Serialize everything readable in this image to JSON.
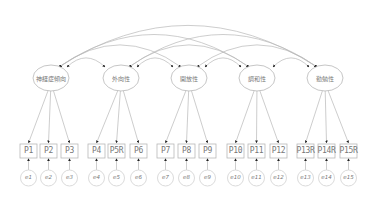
{
  "diagram": {
    "type": "sem-path-diagram",
    "title": "",
    "colors": {
      "line": "#b8b8b8",
      "arrowhead": "#222222",
      "text": "#777777",
      "background": "#ffffff"
    },
    "latent_factors": [
      {
        "id": "F1",
        "label": "神経症傾向",
        "cx": 51,
        "cy": 78
      },
      {
        "id": "F2",
        "label": "外向性",
        "cx": 121,
        "cy": 78
      },
      {
        "id": "F3",
        "label": "開放性",
        "cx": 189,
        "cy": 78
      },
      {
        "id": "F4",
        "label": "調和性",
        "cx": 257,
        "cy": 78
      },
      {
        "id": "F5",
        "label": "勤勉性",
        "cx": 325,
        "cy": 78
      }
    ],
    "observed": [
      {
        "label": "P1",
        "x": 20,
        "factor": "F1",
        "error": "e1"
      },
      {
        "label": "P2",
        "x": 40,
        "factor": "F1",
        "error": "e2"
      },
      {
        "label": "P3",
        "x": 61,
        "factor": "F1",
        "error": "e3"
      },
      {
        "label": "P4",
        "x": 88,
        "factor": "F2",
        "error": "e4"
      },
      {
        "label": "P5R",
        "x": 108,
        "factor": "F2",
        "error": "e5"
      },
      {
        "label": "P6",
        "x": 130,
        "factor": "F2",
        "error": "e6"
      },
      {
        "label": "P7",
        "x": 157,
        "factor": "F3",
        "error": "e7"
      },
      {
        "label": "P8",
        "x": 178,
        "factor": "F3",
        "error": "e8"
      },
      {
        "label": "P9",
        "x": 199,
        "factor": "F3",
        "error": "e9"
      },
      {
        "label": "P10",
        "x": 227,
        "factor": "F4",
        "error": "e10"
      },
      {
        "label": "P11",
        "x": 248,
        "factor": "F4",
        "error": "e11"
      },
      {
        "label": "P12",
        "x": 270,
        "factor": "F4",
        "error": "e12"
      },
      {
        "label": "P13R",
        "x": 297,
        "factor": "F5",
        "error": "e13"
      },
      {
        "label": "P14R",
        "x": 318,
        "factor": "F5",
        "error": "e14"
      },
      {
        "label": "P15R",
        "x": 340,
        "factor": "F5",
        "error": "e15"
      }
    ],
    "errors": [
      "e1",
      "e2",
      "e3",
      "e4",
      "e5",
      "e6",
      "e7",
      "e8",
      "e9",
      "e10",
      "e11",
      "e12",
      "e13",
      "e14",
      "e15"
    ],
    "covariances": [
      [
        "F1",
        "F2"
      ],
      [
        "F2",
        "F3"
      ],
      [
        "F3",
        "F4"
      ],
      [
        "F4",
        "F5"
      ],
      [
        "F1",
        "F3"
      ],
      [
        "F2",
        "F4"
      ],
      [
        "F3",
        "F5"
      ],
      [
        "F1",
        "F4"
      ],
      [
        "F2",
        "F5"
      ],
      [
        "F1",
        "F5"
      ]
    ]
  }
}
